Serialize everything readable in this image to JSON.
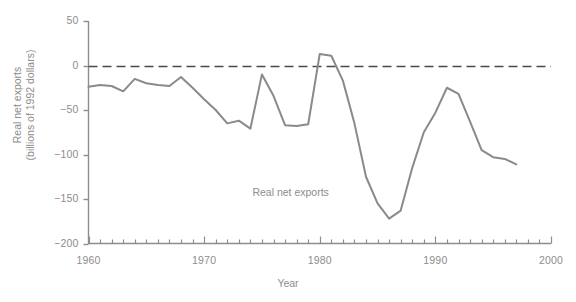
{
  "chart_data": {
    "type": "line",
    "title": "",
    "xlabel": "Year",
    "ylabel": "Real net exports (billions of 1992 dollars)",
    "ylabel_line1": "Real net exports",
    "ylabel_line2": "(billions of 1992 dollars)",
    "xlim": [
      1960,
      2000
    ],
    "ylim": [
      -200,
      50
    ],
    "x_ticks_major": [
      1960,
      1970,
      1980,
      1990,
      2000
    ],
    "x_tick_labels": [
      "1960",
      "1970",
      "1980",
      "1990",
      "2000"
    ],
    "x_tick_minor_step": 1,
    "y_ticks": [
      50,
      0,
      -50,
      -100,
      -150,
      -200
    ],
    "y_tick_labels": [
      "50",
      "0",
      "−50",
      "−100",
      "−150",
      "−200"
    ],
    "grid": false,
    "legend": "none",
    "annotations": [
      {
        "text": "Real net exports",
        "x": 1978.5,
        "y": -143
      }
    ],
    "reference_lines": [
      {
        "value": 0,
        "style": "dashed",
        "color": "#4a4a4a"
      }
    ],
    "series": [
      {
        "name": "Real net exports",
        "color": "#8a8a8a",
        "x": [
          1960,
          1961,
          1962,
          1963,
          1964,
          1965,
          1966,
          1967,
          1968,
          1969,
          1970,
          1971,
          1972,
          1973,
          1974,
          1975,
          1976,
          1977,
          1978,
          1979,
          1980,
          1981,
          1982,
          1983,
          1984,
          1985,
          1986,
          1987,
          1988,
          1989,
          1990,
          1991,
          1992,
          1993,
          1994,
          1995,
          1996,
          1997
        ],
        "y": [
          -24,
          -22,
          -23,
          -29,
          -15,
          -20,
          -22,
          -23,
          -13,
          -25,
          -38,
          -50,
          -65,
          -62,
          -71,
          -10,
          -34,
          -67,
          -68,
          -66,
          13,
          11,
          -17,
          -65,
          -125,
          -155,
          -172,
          -163,
          -115,
          -75,
          -53,
          -25,
          -32,
          -63,
          -95,
          -103,
          -105,
          -111
        ]
      }
    ]
  },
  "axis": {
    "y_title_line1": "Real net exports",
    "y_title_line2": "(billions of 1992 dollars)",
    "x_title": "Year"
  },
  "plot_label": "Real net exports"
}
